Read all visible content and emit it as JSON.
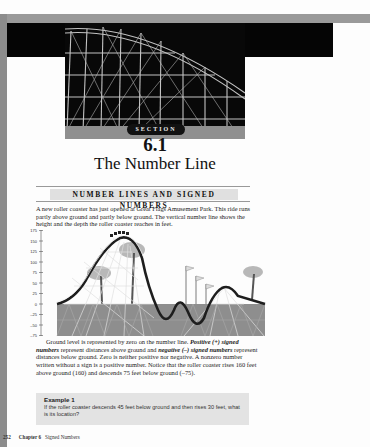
{
  "header": {
    "section_label": "SECTION",
    "section_number": "6.1",
    "section_title": "The Number Line"
  },
  "heading": {
    "text": "NUMBER LINES AND SIGNED NUMBERS"
  },
  "intro_paragraph": "A new roller coaster has just opened at Great Flags Amusement Park. This ride runs partly above ground and partly below ground. The vertical number line shows the height and the depth the roller coaster reaches in feet.",
  "figure": {
    "axis_labels": [
      "175",
      "150",
      "125",
      "100",
      "75",
      "50",
      "25",
      "0",
      "–25",
      "–50",
      "–75"
    ],
    "colors": {
      "ground": "#8e8e8e",
      "track": "#1a1a1a",
      "frame": "#cfcfcf"
    }
  },
  "body_paragraph": {
    "part1": "Ground level is represented by zero on the number line. ",
    "positive_term": "Positive (+) signed numbers",
    "part2": " represent distances above ground and ",
    "negative_term": "negative (–) signed numbers",
    "part3": " represent distances below ground. Zero is neither positive nor negative. A nonzero number written without a sign is a positive number.  Notice that the roller coaster rises 160 feet above ground (160) and descends 75 feet below ground (–75)."
  },
  "example": {
    "title": "Example 1",
    "text": "If the roller coaster descends 45 feet below ground and then rises 30 feet, what is its location?"
  },
  "footer": {
    "page_number": "252",
    "chapter": "Chapter 6",
    "chapter_title": "Signed Numbers"
  }
}
